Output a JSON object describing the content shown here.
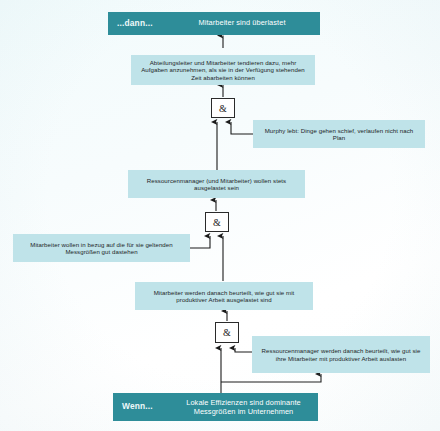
{
  "diagram": {
    "language": "de",
    "colors": {
      "banner_fill": "#2e8d99",
      "banner_text": "#ffffff",
      "entity_fill": "#bfe3e9",
      "entity_text": "#1d2528",
      "gate_fill": "#ffffff",
      "gate_border": "#2a2a2a",
      "arrow": "#1b1b1b",
      "page_background": "#f4fbfc"
    },
    "banners": {
      "top": {
        "key": "...dann...",
        "text": "Mitarbeiter sind überlastet"
      },
      "bottom": {
        "key": "Wenn...",
        "text": "Lokale Effizienzen sind dominante Messgrößen im Unternehmen"
      }
    },
    "gates": [
      {
        "id": "gate-1",
        "label": "&"
      },
      {
        "id": "gate-2",
        "label": "&"
      },
      {
        "id": "gate-3",
        "label": "&"
      }
    ],
    "entities": [
      {
        "id": "entity-overload-cause",
        "text": "Abteilungsleiter und Mitarbeiter tendieren dazu, mehr Aufgaben anzunehmen, als sie in der Verfügung stehenden Zeit abarbeiten können"
      },
      {
        "id": "entity-murphy",
        "text": "Murphy lebt: Dinge gehen schief, verlaufen nicht nach Plan"
      },
      {
        "id": "entity-resource-manager-wish",
        "text": "Ressourcenmanager (und Mitarbeiter) wollen stets ausgelastet sein"
      },
      {
        "id": "entity-employee-metrics",
        "text": "Mitarbeiter wollen in bezug auf die für sie geltenden Messgrößen gut dastehen"
      },
      {
        "id": "entity-employee-evaluation",
        "text": "Mitarbeiter werden danach beurteilt, wie gut sie mit produktiver Arbeit ausgelastet sind"
      },
      {
        "id": "entity-manager-evaluation",
        "text": "Ressourcenmanager werden danach beurteilt, wie gut sie ihre Mitarbeiter mit produktiver Arbeit auslasten"
      }
    ]
  }
}
